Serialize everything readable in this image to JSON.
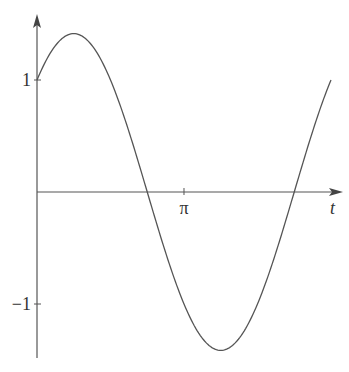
{
  "chart_data": {
    "type": "line",
    "title": "",
    "xlabel": "t",
    "ylabel": "",
    "function": "sin(t) + cos(t)",
    "x_range": [
      0,
      6.2832
    ],
    "ylim": [
      -1.5,
      1.6
    ],
    "x_ticks": [
      {
        "value": 3.14159,
        "label": "π"
      }
    ],
    "y_ticks": [
      {
        "value": 1,
        "label": "1"
      },
      {
        "value": -1,
        "label": "−1"
      }
    ],
    "grid": false,
    "legend": null,
    "series": [
      {
        "name": "f(t)",
        "x": [
          0,
          0.7854,
          1.5708,
          2.3562,
          3.1416,
          3.927,
          4.7124,
          5.4978,
          6.2832
        ],
        "values": [
          1,
          1.414,
          1,
          0,
          -1,
          -1.414,
          -1,
          0,
          1
        ]
      }
    ],
    "annotations": {
      "peak": {
        "t": 0.7854,
        "value": 1.414
      },
      "trough": {
        "t": 3.927,
        "value": -1.414
      }
    },
    "colors": {
      "curve": "#555555",
      "axes": "#555555"
    }
  }
}
